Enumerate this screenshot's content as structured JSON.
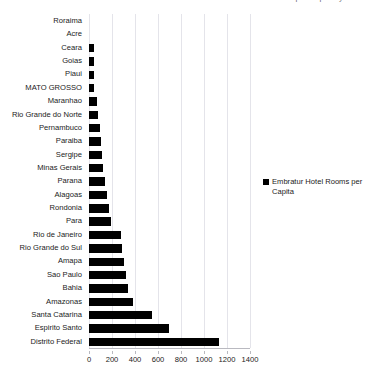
{
  "chart_data": {
    "type": "bar",
    "orientation": "horizontal",
    "title": "Embratur Hotel Rooms per Capita by State",
    "xlabel": "",
    "ylabel": "",
    "xlim": [
      0,
      1400
    ],
    "xticks": [
      0,
      200,
      400,
      600,
      800,
      1000,
      1200,
      1400
    ],
    "grid": true,
    "legend_position": "right",
    "series_name": "Embratur Hotel Rooms per Capita",
    "bar_color": "#000000",
    "categories": [
      "Roraima",
      "Acre",
      "Ceara",
      "Goias",
      "Piaui",
      "MATO GROSSO",
      "Maranhao",
      "Rio Grande do Norte",
      "Pernambuco",
      "Paraiba",
      "Sergipe",
      "Minas Gerais",
      "Parana",
      "Alagoas",
      "Rondonia",
      "Para",
      "Rio de Janeiro",
      "Rio Grande do Sul",
      "Amapa",
      "Sao Paulo",
      "Bahia",
      "Amazonas",
      "Santa Catarina",
      "Espirito Santo",
      "Distrito Federal"
    ],
    "values": [
      0,
      0,
      45,
      45,
      45,
      45,
      70,
      80,
      95,
      100,
      110,
      120,
      140,
      160,
      175,
      195,
      275,
      290,
      300,
      320,
      340,
      380,
      550,
      695,
      1130
    ]
  },
  "legend": {
    "label": "Embratur Hotel Rooms per Capita"
  }
}
